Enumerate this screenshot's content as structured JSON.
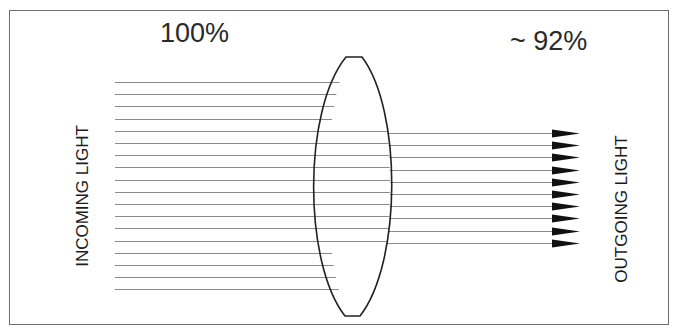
{
  "diagram": {
    "labels": {
      "incoming_percent": "100%",
      "outgoing_percent": "~ 92%",
      "incoming": "INCOMING LIGHT",
      "outgoing": "OUTGOING LIGHT"
    },
    "incoming_rays": {
      "count": 18,
      "start_x": 115,
      "first_y": 82,
      "spacing": 12.2
    },
    "outgoing_rays": {
      "count": 10,
      "end_x": 552,
      "first_y": 133,
      "spacing": 12.2,
      "arrowheads": true
    },
    "lens": {
      "type": "biconvex",
      "center_x": 354,
      "top_y": 57,
      "bottom_y": 316
    },
    "colors": {
      "stroke": "#222222",
      "ray": "#8a8a8a",
      "frame": "#6e6e6e"
    }
  }
}
